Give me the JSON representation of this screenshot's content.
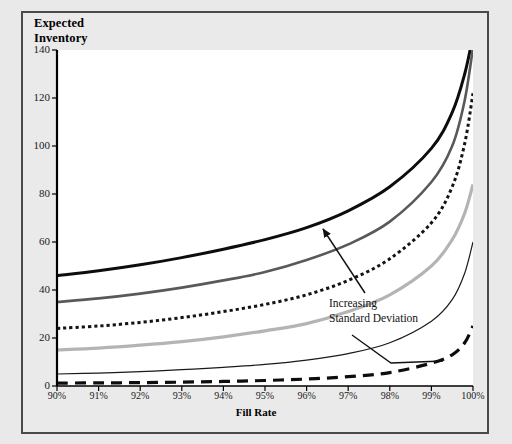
{
  "figure": {
    "title_line1": "Expected",
    "title_line2": "Inventory",
    "annotation_line1": "Increasing",
    "annotation_line2": "Standard Deviation"
  },
  "colors": {
    "page_background": "#e9e9e9",
    "frame_border": "#4a4a4a",
    "plot_background": "#ffffff",
    "axis": "#000000",
    "series_black_thick": "#0d0d0d",
    "series_dark_gray": "#595959",
    "series_dotted": "#141414",
    "series_light_gray": "#b4b4b4",
    "series_black_thin": "#1a1a1a",
    "series_black_dashed": "#0d0d0d"
  },
  "chart_data": {
    "type": "line",
    "title": "Expected Inventory",
    "xlabel": "Fill Rate",
    "ylabel": "Expected Inventory",
    "xlim": [
      90,
      100
    ],
    "ylim": [
      0,
      140
    ],
    "grid": false,
    "legend": "none",
    "x": [
      90,
      91,
      92,
      93,
      94,
      95,
      96,
      97,
      98,
      99,
      99.5,
      99.8,
      100
    ],
    "xtick_labels": [
      "90%",
      "91%",
      "92%",
      "93%",
      "94%",
      "95%",
      "96%",
      "97%",
      "98%",
      "99%",
      "100%"
    ],
    "xticks": [
      90,
      91,
      92,
      93,
      94,
      95,
      96,
      97,
      98,
      99,
      100
    ],
    "yticks": [
      0,
      20,
      40,
      60,
      80,
      100,
      120,
      140
    ],
    "ytick_labels": [
      "0",
      "20",
      "40",
      "60",
      "80",
      "100",
      "120",
      "140"
    ],
    "annotations": [
      {
        "text": "Increasing Standard Deviation",
        "points_to": "higher standard deviation curves",
        "arrow": true
      }
    ],
    "series": [
      {
        "name": "Std Dev 6 (largest)",
        "style": "solid",
        "width": 3.0,
        "color": "#0d0d0d",
        "values": [
          46,
          48,
          50.5,
          53.5,
          57,
          61,
          66,
          73,
          83,
          99,
          114,
          130,
          146
        ]
      },
      {
        "name": "Std Dev 5",
        "style": "solid",
        "width": 2.6,
        "color": "#595959",
        "values": [
          35,
          36.5,
          38.5,
          41,
          44,
          47.5,
          52.5,
          59,
          68.5,
          85,
          100,
          119,
          141
        ]
      },
      {
        "name": "Std Dev 4",
        "style": "dotted",
        "width": 3.0,
        "color": "#141414",
        "values": [
          24,
          25,
          26.5,
          28.5,
          31,
          34,
          38,
          44,
          53,
          68,
          83,
          101,
          122
        ]
      },
      {
        "name": "Std Dev 3",
        "style": "solid",
        "width": 3.2,
        "color": "#b4b4b4",
        "values": [
          15,
          15.8,
          17,
          18.5,
          20.5,
          23,
          26,
          31,
          38,
          50,
          61,
          72,
          84
        ]
      },
      {
        "name": "Std Dev 2",
        "style": "solid",
        "width": 1.2,
        "color": "#1a1a1a",
        "values": [
          5,
          5.4,
          6,
          6.8,
          7.8,
          9,
          10.8,
          13.5,
          18,
          27,
          36,
          47,
          60
        ]
      },
      {
        "name": "Std Dev 1 (smallest)",
        "style": "dashed",
        "width": 3.2,
        "color": "#0d0d0d",
        "values": [
          1.2,
          1.3,
          1.4,
          1.6,
          1.9,
          2.3,
          2.9,
          3.9,
          5.6,
          9.5,
          13,
          18,
          25
        ]
      }
    ]
  }
}
